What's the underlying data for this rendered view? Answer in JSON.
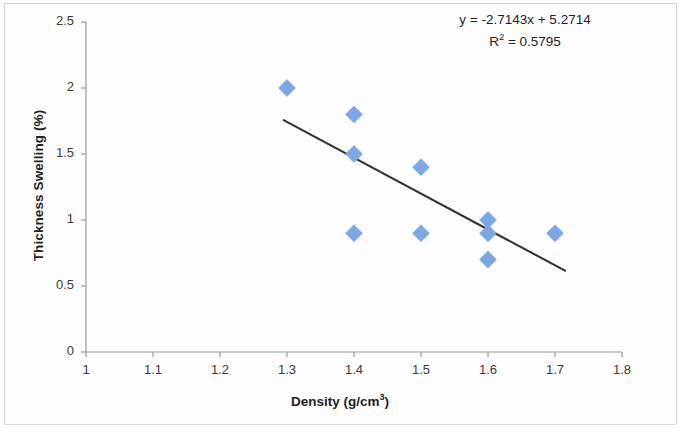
{
  "chart_data": {
    "type": "scatter",
    "title": "",
    "xlabel": "Density (g/cm³)",
    "ylabel": "Thickness Swelling (%)",
    "xlim": [
      1,
      1.8
    ],
    "ylim": [
      0,
      2.5
    ],
    "xticks": [
      "1",
      "1.1",
      "1.2",
      "1.3",
      "1.4",
      "1.5",
      "1.6",
      "1.7",
      "1.8"
    ],
    "xtick_values": [
      1,
      1.1,
      1.2,
      1.3,
      1.4,
      1.5,
      1.6,
      1.7,
      1.8
    ],
    "yticks": [
      "0",
      "0.5",
      "1",
      "1.5",
      "2",
      "2.5"
    ],
    "ytick_values": [
      0,
      0.5,
      1,
      1.5,
      2,
      2.5
    ],
    "grid": false,
    "legend": false,
    "marker": "diamond",
    "marker_color": "#7BA7E4",
    "points": [
      {
        "x": 1.3,
        "y": 2.0
      },
      {
        "x": 1.4,
        "y": 1.8
      },
      {
        "x": 1.4,
        "y": 1.5
      },
      {
        "x": 1.4,
        "y": 0.9
      },
      {
        "x": 1.5,
        "y": 1.4
      },
      {
        "x": 1.5,
        "y": 0.9
      },
      {
        "x": 1.6,
        "y": 1.0
      },
      {
        "x": 1.6,
        "y": 0.9
      },
      {
        "x": 1.6,
        "y": 0.7
      },
      {
        "x": 1.7,
        "y": 0.9
      }
    ],
    "trendline": {
      "type": "linear",
      "slope": -2.7143,
      "intercept": 5.2714,
      "x_start": 1.295,
      "x_end": 1.715,
      "color": "#333333"
    },
    "annotations": {
      "equation": "y = -2.7143x + 5.2714",
      "r_squared_label": "R",
      "r_squared_exponent": "2",
      "r_squared_value": " = 0.5795",
      "r_squared_full": "R² = 0.5795"
    }
  },
  "axes": {
    "x_title_main": "Density (g/cm",
    "x_title_sup": "3",
    "x_title_tail": ")",
    "y_title": "Thickness Swelling (%)"
  }
}
